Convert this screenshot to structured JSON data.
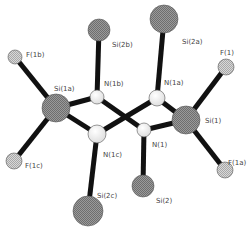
{
  "diagram": {
    "type": "molecular-structure",
    "atoms": [
      {
        "id": "Si2b",
        "label": "Si(2b)",
        "element": "Si",
        "x": 99,
        "y": 30,
        "r": 11,
        "lx": 112,
        "ly": 47
      },
      {
        "id": "Si2a",
        "label": "Si(2a)",
        "element": "Si",
        "x": 164,
        "y": 19,
        "r": 14,
        "lx": 182,
        "ly": 44
      },
      {
        "id": "F1b",
        "label": "F(1b)",
        "element": "F",
        "x": 15,
        "y": 57,
        "r": 7,
        "lx": 26,
        "ly": 57
      },
      {
        "id": "F1",
        "label": "F(1)",
        "element": "F",
        "x": 226,
        "y": 67,
        "r": 8,
        "lx": 220,
        "ly": 55
      },
      {
        "id": "Si1a",
        "label": "Si(1a)",
        "element": "Si",
        "x": 56,
        "y": 108,
        "r": 14,
        "lx": 54,
        "ly": 91
      },
      {
        "id": "N1b",
        "label": "N(1b)",
        "element": "N",
        "x": 97,
        "y": 97,
        "r": 7,
        "lx": 104,
        "ly": 86
      },
      {
        "id": "N1a",
        "label": "N(1a)",
        "element": "N",
        "x": 157,
        "y": 98,
        "r": 8,
        "lx": 164,
        "ly": 85
      },
      {
        "id": "Si1",
        "label": "Si(1)",
        "element": "Si",
        "x": 186,
        "y": 120,
        "r": 14,
        "lx": 205,
        "ly": 123
      },
      {
        "id": "N1c",
        "label": "N(1c)",
        "element": "N",
        "x": 97,
        "y": 134,
        "r": 9,
        "lx": 103,
        "ly": 157
      },
      {
        "id": "N1",
        "label": "N(1)",
        "element": "N",
        "x": 144,
        "y": 130,
        "r": 7,
        "lx": 152,
        "ly": 147
      },
      {
        "id": "F1c",
        "label": "F(1c)",
        "element": "F",
        "x": 14,
        "y": 161,
        "r": 8,
        "lx": 25,
        "ly": 168
      },
      {
        "id": "F1a",
        "label": "F(1a)",
        "element": "F",
        "x": 225,
        "y": 170,
        "r": 8,
        "lx": 228,
        "ly": 165
      },
      {
        "id": "Si2c",
        "label": "Si(2c)",
        "element": "Si",
        "x": 88,
        "y": 211,
        "r": 15,
        "lx": 97,
        "ly": 198
      },
      {
        "id": "Si2",
        "label": "Si(2)",
        "element": "Si",
        "x": 143,
        "y": 186,
        "r": 11,
        "lx": 156,
        "ly": 203
      }
    ],
    "bonds": [
      [
        "Si2b",
        "N1b"
      ],
      [
        "Si2a",
        "N1a"
      ],
      [
        "F1b",
        "Si1a"
      ],
      [
        "F1c",
        "Si1a"
      ],
      [
        "Si1a",
        "N1b"
      ],
      [
        "Si1a",
        "N1c"
      ],
      [
        "N1b",
        "N1"
      ],
      [
        "N1c",
        "N1a"
      ],
      [
        "N1a",
        "Si1"
      ],
      [
        "N1",
        "Si1"
      ],
      [
        "F1",
        "Si1"
      ],
      [
        "F1a",
        "Si1"
      ],
      [
        "N1c",
        "Si2c"
      ],
      [
        "N1",
        "Si2"
      ]
    ],
    "colors": {
      "bond": "#111111",
      "Si_fill": "#8a8a8a",
      "F_fill": "#c4c4c4",
      "N_fill": "#f2f2f2",
      "outline": "#555555",
      "label": "#444444"
    }
  }
}
